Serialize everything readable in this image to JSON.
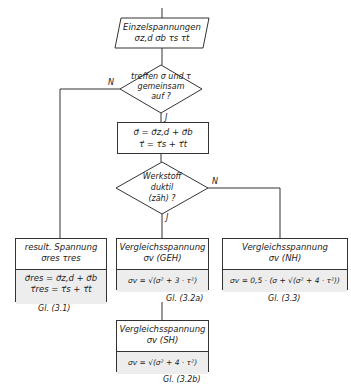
{
  "input": {
    "title": "Einzelspannungen",
    "vars": "σz,d  σb  τs  τt"
  },
  "decision1": {
    "text": [
      "treffen σ und τ",
      "gemeinsam",
      "auf ?"
    ],
    "no": "N",
    "yes": "J"
  },
  "combine": {
    "line1": "σ⃗ = σ⃗z,d + σ⃗b",
    "line2": "τ⃗ =  τ⃗s + τ⃗t"
  },
  "decision2": {
    "text": [
      "Werkstoff",
      "duktil",
      "(zäh) ?"
    ],
    "no": "N",
    "yes": "J"
  },
  "boxes": {
    "resultant": {
      "title": "result. Spannung",
      "sub": "σres    τres",
      "eq1": "σ⃗res = σ⃗z,d + σ⃗b",
      "eq2": "τ⃗res  =  τ⃗s + τ⃗t",
      "ref": "Gl. (3.1)"
    },
    "geh": {
      "title": "Vergleichsspannung",
      "sub": "σv (GEH)",
      "eq": "σv = √(σ² + 3 · τ²)",
      "ref": "Gl. (3.2a)"
    },
    "nh": {
      "title": "Vergleichsspannung",
      "sub": "σv (NH)",
      "eq": "σv = 0,5 · (σ + √(σ² + 4 · τ²))",
      "ref": "Gl. (3.3)"
    },
    "sh": {
      "title": "Vergleichsspannung",
      "sub": "σv (SH)",
      "eq": "σv = √(σ² + 4 · τ²)",
      "ref": "Gl. (3.2b)"
    }
  }
}
